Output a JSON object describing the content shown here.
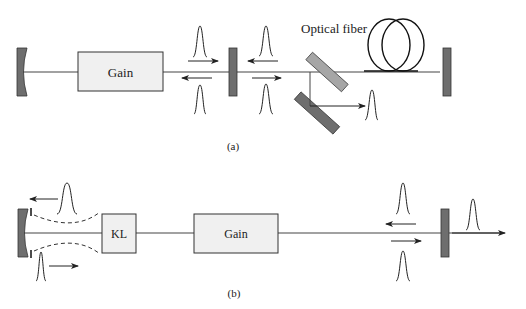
{
  "figure": {
    "panel_a": {
      "caption": "(a)",
      "gain_label": "Gain",
      "fiber_label": "Optical fiber",
      "components": [
        "curved-end-mirror",
        "gain-medium",
        "output-coupler",
        "beam-splitter-pair",
        "optical-fiber-coil",
        "flat-end-mirror"
      ]
    },
    "panel_b": {
      "caption": "(b)",
      "kl_label": "KL",
      "gain_label": "Gain",
      "components": [
        "curved-end-mirror-with-aperture",
        "kerr-lens",
        "gain-medium",
        "output-coupler"
      ]
    },
    "colors": {
      "mirror_dark": "#6e6e6e",
      "mirror_light": "#a6a6a6",
      "box_fill": "#f0f0f0",
      "line": "#333333"
    }
  }
}
